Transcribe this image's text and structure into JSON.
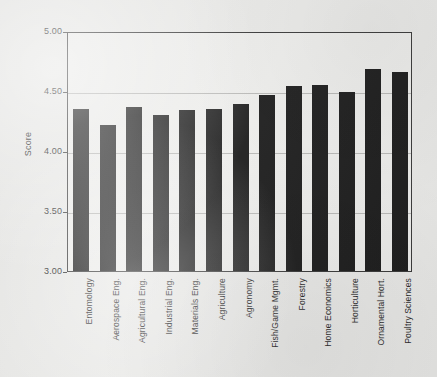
{
  "chart_data": {
    "type": "bar",
    "title": "",
    "xlabel": "",
    "ylabel": "Score",
    "ylim": [
      3.0,
      5.0
    ],
    "yticks": [
      "3.00",
      "3.50",
      "4.00",
      "4.50",
      "5.00"
    ],
    "ytick_values": [
      3.0,
      3.5,
      4.0,
      4.5,
      5.0
    ],
    "grid": "horizontal",
    "legend": "none",
    "bar_color": "#1d1d1d",
    "categories": [
      "Entomology",
      "Aerospace Eng.",
      "Agricultural Eng.",
      "Industrial Eng.",
      "Materials Eng.",
      "Agriculture",
      "Agronomy",
      "Fish/Game Mgmt.",
      "Forestry",
      "Home Economics",
      "Horticulture",
      "Ornamental Hort.",
      "Poultry Sciences"
    ],
    "values": [
      4.35,
      4.22,
      4.37,
      4.3,
      4.34,
      4.35,
      4.39,
      4.47,
      4.54,
      4.55,
      4.49,
      4.68,
      4.66
    ]
  }
}
